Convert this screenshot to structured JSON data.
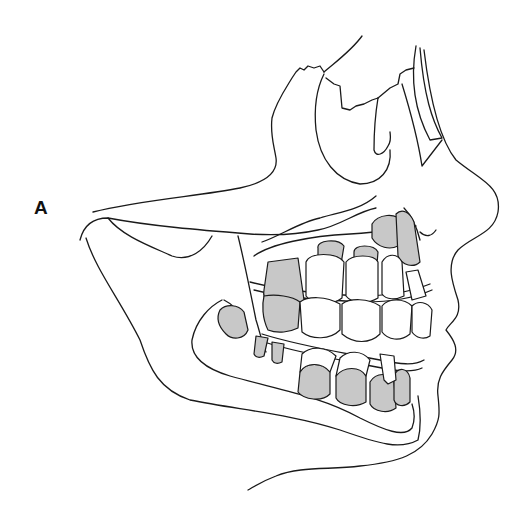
{
  "figure": {
    "panel_label": "A",
    "colors": {
      "line": "#1a1a1a",
      "developing_tooth_fill": "#c8c8c8",
      "erupted_tooth_fill": "#ffffff",
      "background": "#ffffff"
    }
  }
}
